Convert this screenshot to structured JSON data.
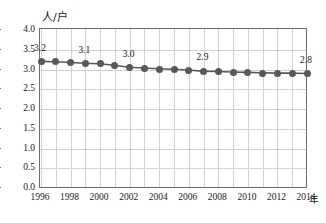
{
  "chart_data": {
    "type": "line",
    "title": "",
    "subtitle": "",
    "xlabel": "年",
    "ylabel": "人/户",
    "y_unit_caption": "人/户",
    "x_unit_caption": "年",
    "xlim": [
      1996,
      2014
    ],
    "ylim": [
      0.0,
      4.0
    ],
    "grid": true,
    "legend": "none",
    "x": [
      1996,
      1997,
      1998,
      1999,
      2000,
      2001,
      2002,
      2003,
      2004,
      2005,
      2006,
      2007,
      2008,
      2009,
      2010,
      2011,
      2012,
      2013,
      2014
    ],
    "values": [
      3.2,
      3.19,
      3.17,
      3.15,
      3.14,
      3.1,
      3.05,
      3.03,
      3.01,
      3.0,
      2.98,
      2.95,
      2.94,
      2.93,
      2.92,
      2.91,
      2.9,
      2.9,
      2.89
    ],
    "xticks": [
      "1996",
      "1998",
      "2000",
      "2002",
      "2004",
      "2006",
      "2008",
      "2010",
      "2012",
      "2014"
    ],
    "xtick_values": [
      1996,
      1998,
      2000,
      2002,
      2004,
      2006,
      2008,
      2010,
      2012,
      2014
    ],
    "yticks": [
      "0.0",
      "0.5",
      "1.0",
      "1.5",
      "2.0",
      "2.5",
      "3.0",
      "3.5",
      "4.0"
    ],
    "ytick_values": [
      0.0,
      0.5,
      1.0,
      1.5,
      2.0,
      2.5,
      3.0,
      3.5,
      4.0
    ],
    "annotations": [
      {
        "label": "3.2",
        "x": 1996,
        "y": 3.2
      },
      {
        "label": "3.1",
        "x": 1999,
        "y": 3.15
      },
      {
        "label": "3.0",
        "x": 2002,
        "y": 3.05
      },
      {
        "label": "2.9",
        "x": 2007,
        "y": 2.95
      },
      {
        "label": "2.8",
        "x": 2014,
        "y": 2.89
      }
    ],
    "series_color": "#585858",
    "grid_color": "#d2d2d2",
    "axis_color": "#6e6e6e"
  }
}
